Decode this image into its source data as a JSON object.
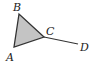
{
  "diagram": {
    "points": {
      "A": {
        "label": "A",
        "x": 14,
        "y": 47,
        "lx": 6,
        "ly": 61
      },
      "B": {
        "label": "B",
        "x": 19,
        "y": 14,
        "lx": 13,
        "ly": 11
      },
      "C": {
        "label": "C",
        "x": 44,
        "y": 37,
        "lx": 46,
        "ly": 35
      },
      "D": {
        "label": "D",
        "x": 78,
        "y": 44,
        "lx": 80,
        "ly": 51
      }
    },
    "triangle": [
      "A",
      "B",
      "C"
    ],
    "segment": [
      "C",
      "D"
    ],
    "colors": {
      "fill": "#c4c4c4",
      "stroke": "#333333"
    }
  }
}
